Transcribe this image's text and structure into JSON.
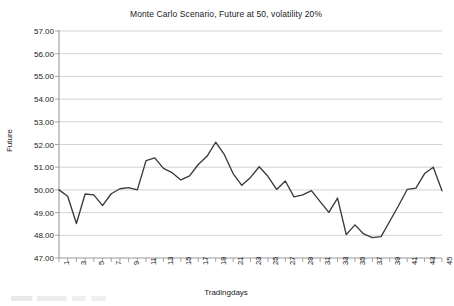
{
  "chart_data": {
    "type": "line",
    "title": "Monte Carlo Scenario, Future at 50, volatility 20%",
    "xlabel": "Tradingdays",
    "ylabel": "Future",
    "ylim": [
      47.0,
      57.0
    ],
    "ytick_step": 1.0,
    "ytick_labels": [
      "57.00",
      "56.00",
      "55.00",
      "54.00",
      "53.00",
      "52.00",
      "51.00",
      "50.00",
      "49.00",
      "48.00",
      "47.00"
    ],
    "xlim": [
      1,
      45
    ],
    "xtick_labels": [
      "1",
      "3",
      "5",
      "7",
      "9",
      "11",
      "13",
      "15",
      "17",
      "19",
      "21",
      "23",
      "25",
      "27",
      "29",
      "31",
      "33",
      "35",
      "37",
      "39",
      "41",
      "43",
      "45"
    ],
    "xtick_rotation": -90,
    "grid": "horizontal",
    "legend": "none",
    "line_color": "#3a3a3a",
    "grid_color": "#c8c8c8",
    "axis_color": "#9a9a9a",
    "series": [
      {
        "name": "Future",
        "x": [
          1,
          2,
          3,
          4,
          5,
          6,
          7,
          8,
          9,
          10,
          11,
          12,
          13,
          14,
          15,
          16,
          17,
          18,
          19,
          20,
          21,
          22,
          23,
          24,
          25,
          26,
          27,
          28,
          29,
          30,
          31,
          32,
          33,
          34,
          35,
          36,
          37,
          38,
          39,
          40,
          41,
          42,
          43,
          44,
          45
        ],
        "values": [
          50.0,
          49.72,
          48.52,
          49.82,
          49.78,
          49.31,
          49.83,
          50.05,
          50.1,
          50.0,
          51.29,
          51.41,
          50.95,
          50.76,
          50.44,
          50.62,
          51.12,
          51.48,
          52.1,
          51.55,
          50.72,
          50.2,
          50.55,
          51.02,
          50.6,
          50.02,
          50.39,
          49.69,
          49.78,
          49.97,
          49.48,
          49.01,
          49.64,
          48.03,
          48.46,
          48.06,
          47.9,
          47.94,
          48.62,
          49.3,
          50.02,
          50.08,
          50.72,
          51.0,
          49.96
        ]
      }
    ]
  },
  "plot": {
    "left": 59,
    "right": 442,
    "top": 31,
    "bottom": 258
  }
}
